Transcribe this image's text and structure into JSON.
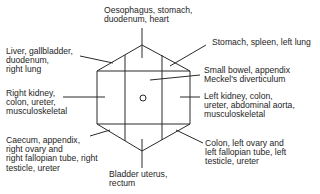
{
  "diagram": {
    "center_marker": "umbilicus-circle",
    "labels": {
      "top": "Oesophagus, stomach,\nduodenum, heart",
      "upper_left": "Liver, gallbladder,\nduodenum,\nright lung",
      "upper_right": "Stomach, spleen, left lung",
      "center_right": "Small bowel, appendix\nMeckel's diverticulum",
      "left": "Right kidney,\ncolon, ureter,\nmusculoskeletal",
      "right": "Left kidney, colon,\nureter, abdominal aorta,\nmusculoskeletal",
      "lower_left": "Caecum, appendix,\nright ovary and\nright fallopian tube, right\ntesticle, ureter",
      "lower_right": "Colon, left ovary and\nleft fallopian tube, left\ntesticle, ureter",
      "bottom": "Bladder uterus,\nrectum"
    },
    "colors": {
      "line": "#2a2a2a",
      "text": "#1e1e1e",
      "background": "#ffffff"
    }
  }
}
